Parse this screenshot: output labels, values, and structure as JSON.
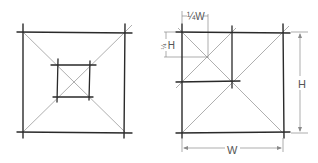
{
  "diagram": {
    "left_figure": {
      "outer_square": {
        "x1": 23,
        "y1": 32,
        "x2": 125,
        "y2": 132
      },
      "inner_square": {
        "x1": 57,
        "y1": 65,
        "x2": 90,
        "y2": 97
      }
    },
    "right_figure": {
      "outer_square": {
        "x1": 182,
        "y1": 32,
        "x2": 283,
        "y2": 132
      },
      "labels": {
        "quarter_width": "¼W",
        "quarter_height_fraction": "¼",
        "quarter_height_letter": "H",
        "height": "H",
        "width": "W"
      }
    },
    "colors": {
      "stroke": "#2a2a2a",
      "guide": "#9a9a9a",
      "dimension": "#8a8a8a",
      "text": "#555555"
    }
  }
}
